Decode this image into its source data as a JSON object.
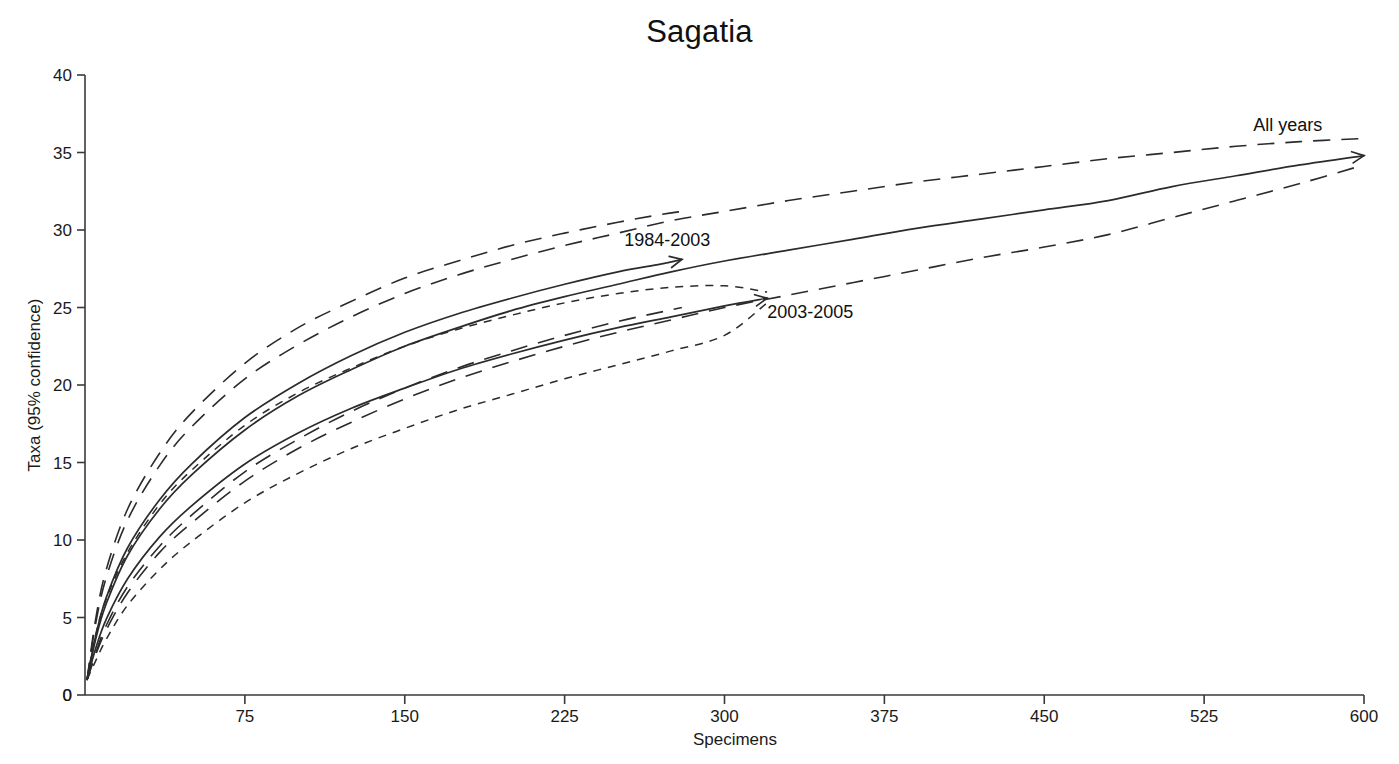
{
  "chart_data": {
    "type": "line",
    "title": "Sagatia",
    "xlabel": "Specimens",
    "ylabel": "Taxa (95% confidence)",
    "xlim": [
      0,
      600
    ],
    "ylim": [
      0,
      40
    ],
    "xticks": [
      0,
      75,
      150,
      225,
      300,
      375,
      450,
      525,
      600
    ],
    "xtick_labels": [
      "0",
      "75",
      "150",
      "225",
      "300",
      "375",
      "450",
      "525",
      "600"
    ],
    "yticks": [
      0,
      5,
      10,
      15,
      20,
      25,
      30,
      35,
      40
    ],
    "ytick_labels": [
      "0",
      "5",
      "10",
      "15",
      "20",
      "25",
      "30",
      "35",
      "40"
    ],
    "grid": false,
    "legend": "inline-annotations",
    "annotations": [
      {
        "text": "All years",
        "x": 548,
        "y": 36.4
      },
      {
        "text": "1984-2003",
        "x": 253,
        "y": 29.0
      },
      {
        "text": "2003-2005",
        "x": 320,
        "y": 24.3
      }
    ],
    "series": [
      {
        "name": "All years",
        "style": "solid",
        "x": [
          1,
          5,
          10,
          20,
          35,
          50,
          75,
          100,
          125,
          150,
          175,
          200,
          225,
          250,
          275,
          300,
          330,
          360,
          390,
          420,
          450,
          480,
          510,
          540,
          570,
          600
        ],
        "y": [
          1.0,
          3.6,
          5.9,
          9.0,
          12.0,
          14.2,
          17.1,
          19.3,
          21.0,
          22.5,
          23.7,
          24.8,
          25.7,
          26.5,
          27.3,
          28.0,
          28.7,
          29.4,
          30.1,
          30.7,
          31.3,
          31.9,
          32.8,
          33.5,
          34.2,
          34.8
        ],
        "ci_upper": [
          1.0,
          4.6,
          7.6,
          11.3,
          14.8,
          17.3,
          20.4,
          22.6,
          24.4,
          25.9,
          27.1,
          28.1,
          29.0,
          29.8,
          30.6,
          31.2,
          31.9,
          32.5,
          33.1,
          33.6,
          34.1,
          34.6,
          35.0,
          35.4,
          35.7,
          35.9
        ],
        "ci_lower": [
          1.0,
          2.6,
          4.2,
          6.6,
          9.2,
          11.1,
          13.8,
          15.9,
          17.6,
          19.1,
          20.4,
          21.5,
          22.5,
          23.4,
          24.2,
          25.0,
          25.8,
          26.6,
          27.4,
          28.2,
          28.9,
          29.7,
          30.8,
          31.9,
          33.0,
          34.2
        ]
      },
      {
        "name": "1984-2003",
        "style": "solid",
        "x": [
          1,
          5,
          10,
          20,
          35,
          50,
          75,
          100,
          125,
          150,
          175,
          200,
          225,
          250,
          270,
          280
        ],
        "y": [
          1.0,
          3.8,
          6.3,
          9.5,
          12.6,
          14.9,
          17.9,
          20.1,
          21.9,
          23.4,
          24.6,
          25.6,
          26.5,
          27.3,
          27.8,
          28.1
        ],
        "ci_upper": [
          1.0,
          4.9,
          8.1,
          12.0,
          15.6,
          18.2,
          21.4,
          23.7,
          25.4,
          26.9,
          28.0,
          29.0,
          29.8,
          30.5,
          31.0,
          31.2
        ],
        "ci_lower": [
          1.0,
          2.7,
          4.5,
          7.0,
          9.6,
          11.6,
          14.4,
          16.5,
          18.3,
          19.8,
          21.1,
          22.2,
          23.2,
          24.1,
          24.7,
          25.0
        ]
      },
      {
        "name": "2003-2005",
        "style": "solid",
        "x": [
          1,
          5,
          10,
          20,
          35,
          50,
          75,
          100,
          125,
          150,
          175,
          200,
          225,
          250,
          275,
          300,
          320
        ],
        "y": [
          1.0,
          3.0,
          4.9,
          7.5,
          10.2,
          12.2,
          14.9,
          16.9,
          18.5,
          19.8,
          21.0,
          22.0,
          22.9,
          23.7,
          24.4,
          25.1,
          25.6
        ],
        "ci_upper": [
          1.0,
          3.9,
          6.2,
          9.2,
          12.3,
          14.5,
          17.4,
          19.5,
          21.1,
          22.5,
          23.6,
          24.5,
          25.3,
          25.9,
          26.3,
          26.4,
          26.0
        ],
        "ci_lower": [
          1.0,
          2.2,
          3.6,
          5.8,
          8.1,
          9.9,
          12.4,
          14.3,
          15.9,
          17.2,
          18.4,
          19.4,
          20.4,
          21.3,
          22.2,
          23.2,
          25.3
        ]
      }
    ]
  },
  "figure": {
    "title": "Sagatia",
    "xlabel": "Specimens",
    "ylabel": "Taxa (95% confidence)"
  }
}
